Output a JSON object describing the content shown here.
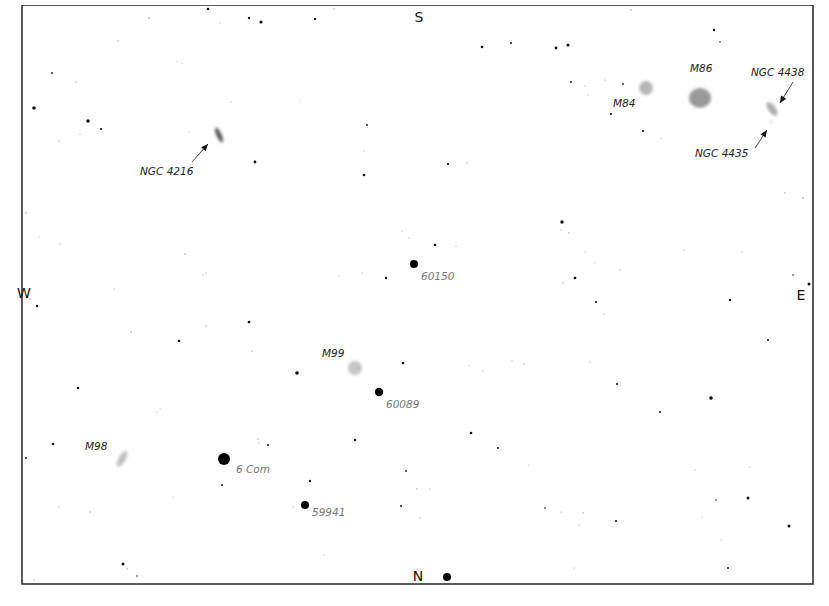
{
  "chart": {
    "frame": {
      "x": 22,
      "y": 5,
      "width": 791,
      "height": 579,
      "border_color": "#333333"
    },
    "top_caption_clipped": true,
    "cardinals": [
      {
        "id": "south",
        "label": "S",
        "x": 419,
        "y": 22
      },
      {
        "id": "north",
        "label": "N",
        "x": 418,
        "y": 581
      },
      {
        "id": "west",
        "label": "W",
        "x": 24,
        "y": 298
      },
      {
        "id": "east",
        "label": "E",
        "x": 801,
        "y": 300
      }
    ],
    "galaxies": [
      {
        "id": "m84",
        "label": "M84",
        "cx": 646,
        "cy": 88,
        "rx": 7,
        "ry": 7,
        "rot": 0,
        "color": "#b8b8b8",
        "label_x": 613,
        "label_y": 107
      },
      {
        "id": "m86",
        "label": "M86",
        "cx": 700,
        "cy": 98,
        "rx": 11,
        "ry": 10,
        "rot": 0,
        "color": "#9a9a9a",
        "label_x": 690,
        "label_y": 72
      },
      {
        "id": "ngc4438",
        "label": "NGC 4438",
        "cx": 772,
        "cy": 109,
        "rx": 3.5,
        "ry": 8,
        "rot": -35,
        "color": "#aaaaaa",
        "label_x": 751,
        "label_y": 76
      },
      {
        "id": "ngc4435",
        "label": "NGC 4435",
        "cx": 771,
        "cy": 122,
        "rx": 1.5,
        "ry": 1.5,
        "rot": 0,
        "color": "#cccccc",
        "label_x": 695,
        "label_y": 157
      },
      {
        "id": "ngc4216",
        "label": "NGC 4216",
        "cx": 219,
        "cy": 135,
        "rx": 2.5,
        "ry": 8,
        "rot": -25,
        "color": "#555555",
        "label_x": 140,
        "label_y": 175
      },
      {
        "id": "m99",
        "label": "M99",
        "cx": 355,
        "cy": 368,
        "rx": 7,
        "ry": 7,
        "rot": 0,
        "color": "#c4c4c4",
        "label_x": 322,
        "label_y": 357
      },
      {
        "id": "m98",
        "label": "M98",
        "cx": 122,
        "cy": 459,
        "rx": 3.5,
        "ry": 9,
        "rot": 30,
        "color": "#c0c0c0",
        "label_x": 85,
        "label_y": 450
      }
    ],
    "pointers": [
      {
        "id": "arrow-ngc4438",
        "x1": 793,
        "y1": 82,
        "x2": 780,
        "y2": 103
      },
      {
        "id": "arrow-ngc4435",
        "x1": 755,
        "y1": 148,
        "x2": 767,
        "y2": 130
      },
      {
        "id": "arrow-ngc4216",
        "x1": 192,
        "y1": 162,
        "x2": 208,
        "y2": 144
      }
    ],
    "labeled_stars": [
      {
        "id": "hip60150",
        "label": "60150",
        "cx": 414,
        "cy": 264,
        "r": 4,
        "label_x": 421,
        "label_y": 280
      },
      {
        "id": "hip60089",
        "label": "60089",
        "cx": 379,
        "cy": 392,
        "r": 4.2,
        "label_x": 386,
        "label_y": 408
      },
      {
        "id": "6com",
        "label": "6 Com",
        "cx": 224,
        "cy": 459,
        "r": 6,
        "label_x": 236,
        "label_y": 473
      },
      {
        "id": "hip59941",
        "label": "59941",
        "cx": 305,
        "cy": 505,
        "r": 4,
        "label_x": 312,
        "label_y": 516
      },
      {
        "id": "north-star",
        "label": "",
        "cx": 447,
        "cy": 577,
        "r": 4,
        "label_x": 0,
        "label_y": 0
      }
    ],
    "stars": [
      [
        208,
        9,
        1.3
      ],
      [
        261,
        22,
        1.6
      ],
      [
        249,
        18,
        1.2
      ],
      [
        149,
        18,
        0.7
      ],
      [
        220,
        23,
        0.6
      ],
      [
        315,
        19,
        1.2
      ],
      [
        334,
        9,
        0.7
      ],
      [
        482,
        47,
        1.3
      ],
      [
        556,
        48,
        1.4
      ],
      [
        568,
        45,
        1.5
      ],
      [
        631,
        10,
        0.7
      ],
      [
        714,
        30,
        1.2
      ],
      [
        720,
        42,
        0.8
      ],
      [
        118,
        41,
        0.7
      ],
      [
        177,
        62,
        0.6
      ],
      [
        182,
        63,
        0.6
      ],
      [
        34,
        108,
        1.8
      ],
      [
        76,
        82,
        0.7
      ],
      [
        52,
        73,
        0.9
      ],
      [
        88,
        121,
        1.7
      ],
      [
        101,
        129,
        1.1
      ],
      [
        80,
        134,
        0.6
      ],
      [
        59,
        141,
        0.7
      ],
      [
        189,
        132,
        0.6
      ],
      [
        255,
        162,
        1.4
      ],
      [
        364,
        175,
        1.3
      ],
      [
        300,
        101,
        0.6
      ],
      [
        231,
        102,
        0.6
      ],
      [
        367,
        125,
        0.9
      ],
      [
        364,
        151,
        0.6
      ],
      [
        448,
        164,
        1.1
      ],
      [
        467,
        163,
        0.7
      ],
      [
        511,
        43,
        1.0
      ],
      [
        571,
        82,
        0.9
      ],
      [
        585,
        86,
        0.6
      ],
      [
        588,
        95,
        0.6
      ],
      [
        605,
        80,
        0.6
      ],
      [
        623,
        84,
        0.9
      ],
      [
        611,
        114,
        1.1
      ],
      [
        643,
        131,
        1.1
      ],
      [
        661,
        138,
        0.6
      ],
      [
        26,
        213,
        0.7
      ],
      [
        39,
        237,
        0.6
      ],
      [
        60,
        244,
        0.6
      ],
      [
        203,
        275,
        0.6
      ],
      [
        30,
        299,
        0.7
      ],
      [
        37,
        306,
        1.2
      ],
      [
        114,
        289,
        0.6
      ],
      [
        131,
        332,
        0.7
      ],
      [
        179,
        341,
        1.3
      ],
      [
        206,
        326,
        0.7
      ],
      [
        249,
        322,
        1.3
      ],
      [
        252,
        351,
        0.7
      ],
      [
        185,
        254,
        0.7
      ],
      [
        206,
        273,
        0.6
      ],
      [
        339,
        276,
        0.6
      ],
      [
        362,
        273,
        0.6
      ],
      [
        386,
        278,
        1.2
      ],
      [
        435,
        245,
        1.3
      ],
      [
        456,
        246,
        0.6
      ],
      [
        402,
        231,
        0.6
      ],
      [
        409,
        238,
        0.6
      ],
      [
        562,
        222,
        1.7
      ],
      [
        561,
        230,
        0.6
      ],
      [
        569,
        233,
        0.7
      ],
      [
        585,
        252,
        0.6
      ],
      [
        595,
        263,
        0.6
      ],
      [
        620,
        270,
        0.6
      ],
      [
        575,
        278,
        1.3
      ],
      [
        563,
        283,
        0.7
      ],
      [
        596,
        302,
        1.1
      ],
      [
        604,
        314,
        0.6
      ],
      [
        684,
        250,
        0.6
      ],
      [
        730,
        300,
        1.2
      ],
      [
        742,
        252,
        0.6
      ],
      [
        785,
        193,
        0.7
      ],
      [
        803,
        198,
        0.7
      ],
      [
        793,
        275,
        0.8
      ],
      [
        809,
        284,
        1.5
      ],
      [
        768,
        340,
        1.0
      ],
      [
        297,
        373,
        1.8
      ],
      [
        403,
        363,
        1.3
      ],
      [
        469,
        366,
        0.6
      ],
      [
        483,
        371,
        0.6
      ],
      [
        512,
        361,
        0.6
      ],
      [
        524,
        364,
        0.7
      ],
      [
        590,
        362,
        0.6
      ],
      [
        617,
        384,
        1.1
      ],
      [
        711,
        398,
        1.8
      ],
      [
        660,
        412,
        1.0
      ],
      [
        78,
        388,
        1.3
      ],
      [
        157,
        412,
        0.6
      ],
      [
        160,
        409,
        0.6
      ],
      [
        53,
        444,
        1.3
      ],
      [
        26,
        458,
        1.0
      ],
      [
        258,
        439,
        0.7
      ],
      [
        259,
        443,
        0.6
      ],
      [
        268,
        445,
        1.0
      ],
      [
        355,
        440,
        1.2
      ],
      [
        471,
        433,
        1.3
      ],
      [
        498,
        448,
        1.0
      ],
      [
        502,
        450,
        0.6
      ],
      [
        529,
        465,
        0.6
      ],
      [
        222,
        485,
        1.0
      ],
      [
        310,
        481,
        1.2
      ],
      [
        293,
        507,
        0.6
      ],
      [
        173,
        497,
        0.6
      ],
      [
        59,
        507,
        0.6
      ],
      [
        90,
        512,
        0.7
      ],
      [
        406,
        471,
        0.9
      ],
      [
        417,
        489,
        0.7
      ],
      [
        430,
        489,
        0.6
      ],
      [
        401,
        506,
        1.0
      ],
      [
        420,
        518,
        0.6
      ],
      [
        545,
        508,
        0.8
      ],
      [
        561,
        512,
        0.6
      ],
      [
        579,
        525,
        0.6
      ],
      [
        583,
        513,
        0.7
      ],
      [
        616,
        521,
        1.1
      ],
      [
        695,
        470,
        0.6
      ],
      [
        716,
        500,
        0.8
      ],
      [
        748,
        498,
        1.5
      ],
      [
        750,
        467,
        0.6
      ],
      [
        702,
        517,
        0.6
      ],
      [
        721,
        540,
        0.6
      ],
      [
        728,
        568,
        1.0
      ],
      [
        789,
        526,
        1.5
      ],
      [
        123,
        564,
        1.5
      ],
      [
        127,
        569,
        0.7
      ],
      [
        137,
        576,
        0.8
      ],
      [
        34,
        580,
        0.6
      ],
      [
        324,
        555,
        0.6
      ],
      [
        574,
        568,
        0.6
      ]
    ]
  }
}
